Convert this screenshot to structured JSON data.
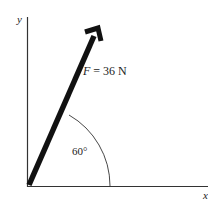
{
  "diagram": {
    "axes": {
      "x_label": "x",
      "y_label": "y"
    },
    "force": {
      "symbol": "F",
      "label": "F = 36 N",
      "magnitude": 36,
      "unit": "N"
    },
    "angle": {
      "label": "60°",
      "degrees": 60,
      "reference": "x-axis"
    },
    "colors": {
      "axis": "#333333",
      "vector": "#111111",
      "arc": "#333333"
    }
  }
}
